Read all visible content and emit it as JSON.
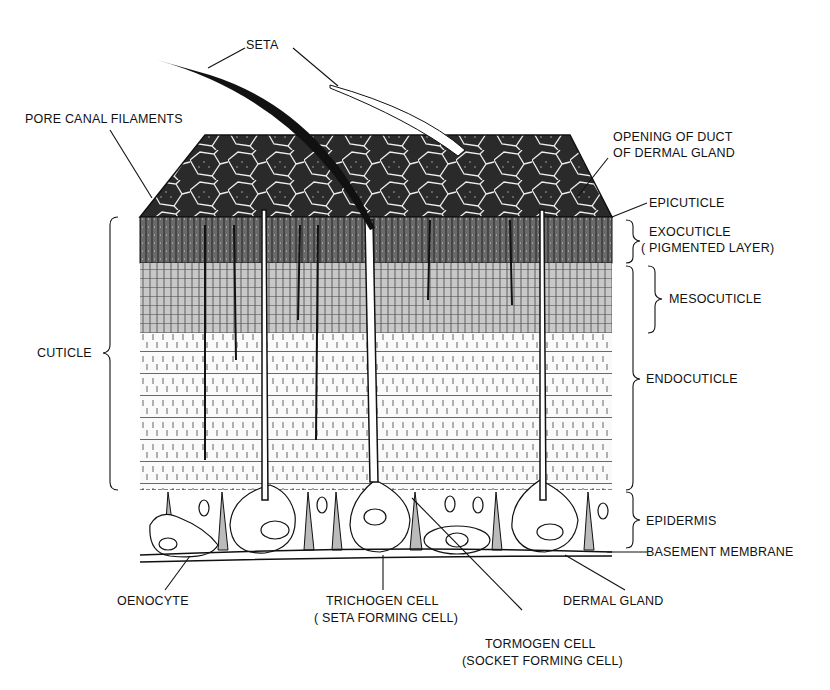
{
  "diagram": {
    "labels": {
      "seta": "SETA",
      "pore_canal_filaments": "PORE CANAL FILAMENTS",
      "opening_of_duct_line1": "OPENING OF DUCT",
      "opening_of_duct_line2": "OF DERMAL GLAND",
      "epicuticle": "EPICUTICLE",
      "exocuticle_line1": "EXOCUTICLE",
      "exocuticle_line2": "( PIGMENTED LAYER)",
      "mesocuticle": "MESOCUTICLE",
      "endocuticle": "ENDOCUTICLE",
      "cuticle": "CUTICLE",
      "epidermis": "EPIDERMIS",
      "basement_membrane": "BASEMENT MEMBRANE",
      "oenocyte": "OENOCYTE",
      "trichogen_line1": "TRICHOGEN CELL",
      "trichogen_line2": "( SETA FORMING CELL)",
      "dermal_gland": "DERMAL GLAND",
      "tormogen_line1": "TORMOGEN CELL",
      "tormogen_line2": "(SOCKET FORMING CELL)"
    },
    "colors": {
      "ink": "#111111",
      "paper": "#ffffff",
      "dark_surface": "#2a2a2a",
      "exocuticle": "#5a5a5a",
      "mesocuticle": "#b5b5b5",
      "endocuticle": "#f4f4f4"
    }
  }
}
